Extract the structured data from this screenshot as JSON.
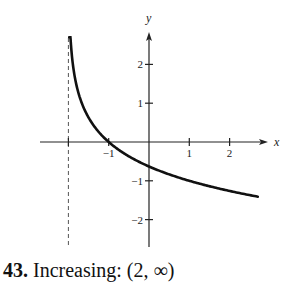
{
  "caption": {
    "number": "43.",
    "text": "Increasing: (2, ∞)"
  },
  "chart_data": {
    "type": "line",
    "title": "",
    "xlabel": "x",
    "ylabel": "y",
    "xlim": [
      -2.7,
      2.85
    ],
    "ylim": [
      -2.7,
      2.85
    ],
    "grid": false,
    "legend": null,
    "x_ticks": [
      -2,
      -1,
      1,
      2
    ],
    "x_tick_labels": [
      "",
      "−1",
      "1",
      "2"
    ],
    "y_ticks": [
      -2,
      -1,
      1,
      2
    ],
    "y_tick_labels": [
      "−2",
      "−1",
      "1",
      "2"
    ],
    "asymptote": {
      "type": "vertical",
      "x": -2,
      "style": "dashed"
    },
    "series": [
      {
        "name": "f(x)",
        "x": [
          -1.98,
          -1.9,
          -1.8,
          -1.6,
          -1.4,
          -1.2,
          -1.0,
          -0.5,
          0.0,
          0.5,
          1.0,
          1.5,
          2.0,
          2.5,
          2.7
        ],
        "y": [
          2.7,
          2.1,
          1.47,
          0.83,
          0.46,
          0.2,
          0.0,
          -0.37,
          -0.63,
          -0.83,
          -1.0,
          -1.14,
          -1.26,
          -1.37,
          -1.41
        ]
      }
    ],
    "annotations": [
      {
        "text": "Increasing: (2, ∞)",
        "position": "below"
      }
    ]
  },
  "colors": {
    "curve": "#111111",
    "axis": "#222222",
    "asymptote": "#555555"
  }
}
